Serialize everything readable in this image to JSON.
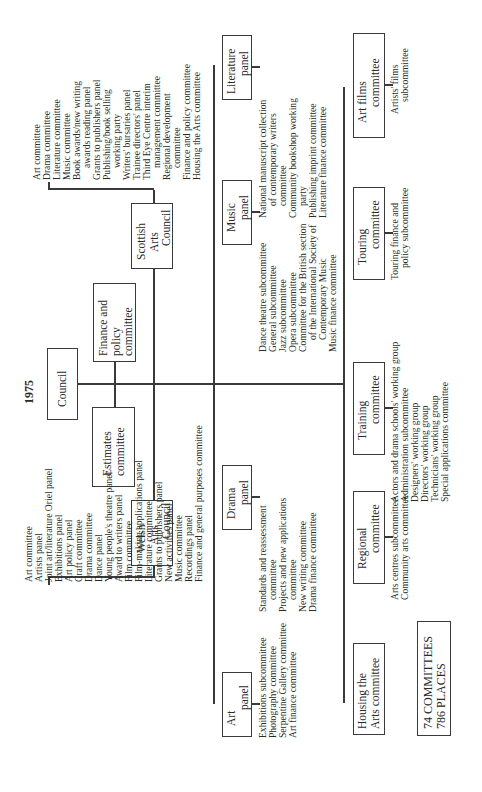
{
  "title": "1975",
  "council": {
    "lines": [
      "Council"
    ]
  },
  "finance_policy": {
    "lines": [
      "Finance and",
      "policy",
      "committee"
    ]
  },
  "estimates": {
    "lines": [
      "Estimates",
      "committee"
    ]
  },
  "scottish": {
    "lines": [
      "Scottish",
      "Arts",
      "Council"
    ],
    "items": [
      {
        "t": "Art committee"
      },
      {
        "t": "Drama committee"
      },
      {
        "t": "Literature committee"
      },
      {
        "t": "Music committee"
      },
      {
        "t": "Book awards/new writing"
      },
      {
        "t": "awards reading panel",
        "indent": true
      },
      {
        "t": "Grants to publishers panel"
      },
      {
        "t": "Publishing/book selling"
      },
      {
        "t": "working party",
        "indent": true
      },
      {
        "t": "Writers' bursaries panel"
      },
      {
        "t": "Trainee directors' panel"
      },
      {
        "t": "Third Eye Centre interim"
      },
      {
        "t": "management committee",
        "indent": true
      },
      {
        "t": "Regional development"
      },
      {
        "t": "committee",
        "indent": true
      },
      {
        "t": "Finance and policy committee"
      },
      {
        "t": "Housing the Arts committee"
      }
    ]
  },
  "welsh": {
    "lines": [
      "Welsh",
      "Arts",
      "Council"
    ],
    "items": [
      {
        "t": "Art committee"
      },
      {
        "t": "Artists panel"
      },
      {
        "t": "Joint art/literature Oriel panel"
      },
      {
        "t": "Exhibitions panel"
      },
      {
        "t": "Art policy panel"
      },
      {
        "t": "Craft committee"
      },
      {
        "t": "Drama committee"
      },
      {
        "t": "Dance panel"
      },
      {
        "t": "Young people's theatre panel"
      },
      {
        "t": "Award to writers panel"
      },
      {
        "t": "Film committee"
      },
      {
        "t": "Film-making applications panel"
      },
      {
        "t": "Literature committee"
      },
      {
        "t": "Grants to publishers panel"
      },
      {
        "t": "New activities panel"
      },
      {
        "t": "Music committee"
      },
      {
        "t": "Recordings panel"
      },
      {
        "t": "Finance and general purposes committee"
      }
    ]
  },
  "literature_panel": {
    "lines": [
      "Literature",
      "panel"
    ],
    "items": [
      {
        "t": "National manuscript collection"
      },
      {
        "t": "of contemporary writers",
        "indent": true
      },
      {
        "t": "committee",
        "indent": true
      },
      {
        "t": "Community bookshop working"
      },
      {
        "t": "party",
        "indent": true
      },
      {
        "t": "Publishing imprint committee"
      },
      {
        "t": "Literature finance committee"
      }
    ]
  },
  "music_panel": {
    "lines": [
      "Music",
      "panel"
    ],
    "items": [
      {
        "t": "Dance theatre subcommittee"
      },
      {
        "t": "General subcommittee"
      },
      {
        "t": "Jazz subcommittee"
      },
      {
        "t": "Opera subcommittee"
      },
      {
        "t": "Committee for the British section"
      },
      {
        "t": "of the International Society of",
        "indent": true
      },
      {
        "t": "Contemporary Music",
        "indent": true
      },
      {
        "t": "Music finance committee"
      }
    ]
  },
  "drama_panel": {
    "lines": [
      "Drama",
      "panel"
    ],
    "items": [
      {
        "t": "Standards and reassessment"
      },
      {
        "t": "committee",
        "indent": true
      },
      {
        "t": "Projects and new applications"
      },
      {
        "t": "committee",
        "indent": true
      },
      {
        "t": "New writing committee"
      },
      {
        "t": "Drama finance committee"
      }
    ]
  },
  "art_panel": {
    "lines": [
      "Art",
      "panel"
    ],
    "items": [
      {
        "t": "Exhibitions subcommittee"
      },
      {
        "t": "Photography committee"
      },
      {
        "t": "Serpentine Gallery committee"
      },
      {
        "t": "Art finance committee"
      }
    ]
  },
  "art_films": {
    "lines": [
      "Art films",
      "committee"
    ],
    "items": [
      {
        "t": "Artists' films"
      },
      {
        "t": "subcommittee",
        "indent": true
      }
    ]
  },
  "touring": {
    "lines": [
      "Touring",
      "committee"
    ],
    "items": [
      {
        "t": "Touring finance and"
      },
      {
        "t": "policy subcommittee",
        "indent": true
      }
    ]
  },
  "training": {
    "lines": [
      "Training",
      "committee"
    ],
    "items": [
      {
        "t": "Actors and drama schools' working group"
      },
      {
        "t": "Administration subcommittee"
      },
      {
        "t": "Designers' working group"
      },
      {
        "t": "Directors' working group"
      },
      {
        "t": "Technicians' working group"
      },
      {
        "t": "Special applications committee"
      }
    ]
  },
  "regional": {
    "lines": [
      "Regional",
      "committee"
    ],
    "items": [
      {
        "t": "Arts centres subcommittee"
      },
      {
        "t": "Community arts committee"
      }
    ]
  },
  "housing": {
    "lines": [
      "Housing the",
      "Arts committee"
    ]
  },
  "summary": {
    "lines": [
      "74 COMMITTEES",
      "786 PLACES"
    ]
  }
}
